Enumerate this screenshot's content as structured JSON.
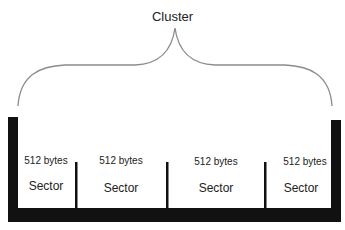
{
  "title": "Cluster",
  "sectors": [
    {
      "size": "512 bytes",
      "label": "Sector"
    },
    {
      "size": "512 bytes",
      "label": "Sector"
    },
    {
      "size": "512 bytes",
      "label": "Sector"
    },
    {
      "size": "512 bytes",
      "label": "Sector"
    }
  ],
  "colors": {
    "bar": "#111111",
    "brace": "#8c8c8c",
    "background": "#ffffff"
  }
}
